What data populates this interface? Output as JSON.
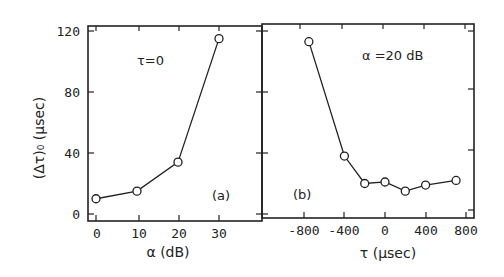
{
  "chart_data": [
    {
      "type": "line",
      "panel": "(a)",
      "annotation": "τ=0",
      "xlabel": "α  (dB)",
      "ylabel": "(Δτ)₀  (µsec)",
      "x_ticks": [
        "0",
        "10",
        "20",
        "30"
      ],
      "y_ticks": [
        "0",
        "40",
        "80",
        "120"
      ],
      "xlim": [
        -2,
        40
      ],
      "ylim": [
        -3,
        125
      ],
      "x": [
        0,
        10,
        20,
        30
      ],
      "series": [
        {
          "name": "(Δτ)₀ vs α",
          "values": [
            10,
            15,
            34,
            115
          ],
          "marker": "open-circle"
        }
      ]
    },
    {
      "type": "line",
      "panel": "(b)",
      "annotation": "α =20 dB",
      "xlabel": "τ   (µsec)",
      "ylabel": "(Δτ)₀  (µsec)",
      "x_ticks": [
        "-800",
        "-400",
        "0",
        "400",
        "800"
      ],
      "y_ticks": [
        "0",
        "40",
        "80",
        "120"
      ],
      "xlim": [
        -1150,
        880
      ],
      "ylim": [
        -3,
        125
      ],
      "x": [
        -750,
        -400,
        -200,
        0,
        200,
        400,
        700
      ],
      "series": [
        {
          "name": "(Δτ)₀ vs τ",
          "values": [
            113,
            38,
            20,
            21,
            15,
            19,
            22
          ],
          "marker": "open-circle"
        }
      ]
    }
  ],
  "labels": {
    "panel_a": "(a)",
    "panel_b": "(b)",
    "anno_a": "τ=0",
    "anno_b": "α =20 dB",
    "ylabel": "(Δτ)₀  (µsec)",
    "xlabel_a": "α   (dB)",
    "xlabel_b": "τ   (µsec)",
    "yt0": "0",
    "yt40": "40",
    "yt80": "80",
    "yt120": "120",
    "xa0": "0",
    "xa10": "10",
    "xa20": "20",
    "xa30": "30",
    "xbm800": "-800",
    "xbm400": "-400",
    "xb0": "0",
    "xb400": "400",
    "xb800": "800"
  }
}
